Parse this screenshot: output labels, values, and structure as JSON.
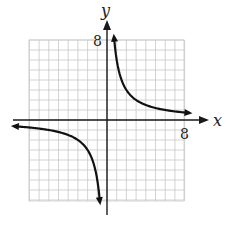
{
  "chart_data": {
    "type": "line",
    "title": "",
    "xlabel": "x",
    "ylabel": "y",
    "xlim": [
      -8,
      8
    ],
    "ylim": [
      -8,
      8
    ],
    "grid": true,
    "grid_step": 1,
    "tick_labels": {
      "x": [
        "8"
      ],
      "y": [
        "8"
      ]
    },
    "function": "y = 6/x",
    "series": [
      {
        "name": "branch-quadrant-I",
        "x": [
          0.7,
          1,
          1.5,
          2,
          3,
          4,
          5,
          6,
          7,
          8.5
        ],
        "y": [
          8.6,
          6,
          4,
          3,
          2,
          1.5,
          1.2,
          1,
          0.86,
          0.71
        ]
      },
      {
        "name": "branch-quadrant-III",
        "x": [
          -9.5,
          -8,
          -7,
          -6,
          -5,
          -4,
          -3,
          -2,
          -1.5,
          -1,
          -0.75
        ],
        "y": [
          -0.63,
          -0.75,
          -0.86,
          -1,
          -1.2,
          -1.5,
          -2,
          -3,
          -4,
          -6,
          -8
        ]
      }
    ],
    "asymptotes": [
      "x = 0",
      "y = 0"
    ]
  },
  "labels": {
    "x_axis": "x",
    "y_axis": "y",
    "x_tick": "8",
    "y_tick": "8"
  },
  "colors": {
    "grid": "#c8c8c8",
    "axis": "#1a1a1a",
    "curve": "#111111"
  }
}
